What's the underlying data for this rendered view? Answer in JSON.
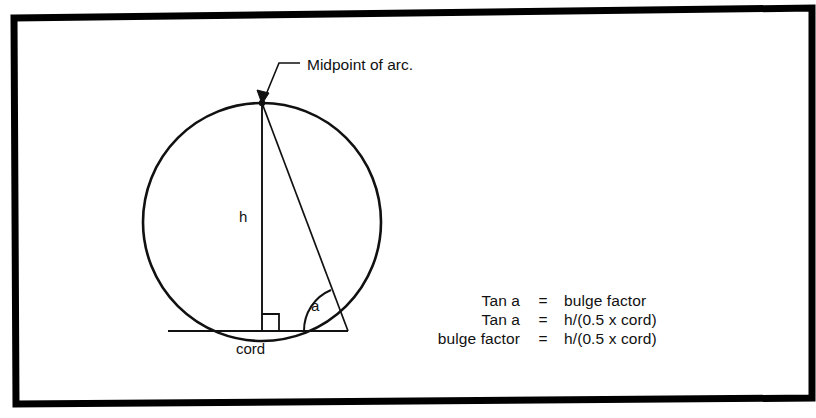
{
  "figure": {
    "background_color": "#ffffff",
    "ink_color": "#111111",
    "border": {
      "name": "page-border",
      "style": "thick black rectangle, slightly skewed (scan artifact)",
      "color": "#000000"
    }
  },
  "labels": {
    "midpoint": "Midpoint of arc.",
    "height": "h",
    "chord": "cord",
    "angle": "a"
  },
  "equations": [
    {
      "lhs": "Tan a",
      "op": "=",
      "rhs": "bulge factor"
    },
    {
      "lhs": "Tan a",
      "op": "=",
      "rhs": "h/(0.5 x cord)"
    },
    {
      "lhs": "bulge factor",
      "op": "=",
      "rhs": "h/(0.5 x cord)"
    }
  ],
  "geometry": {
    "arc_midpoint": {
      "x": 262,
      "y": 103
    },
    "chord_left": {
      "x": 168,
      "y": 331
    },
    "chord_right": {
      "x": 348,
      "y": 331
    },
    "circle_center": {
      "x": 262,
      "y": 222
    },
    "circle_radius": 119,
    "right_angle_marker": "square at foot of h on chord",
    "angle_arc": "arc at right chord endpoint between chord and hypotenuse"
  }
}
